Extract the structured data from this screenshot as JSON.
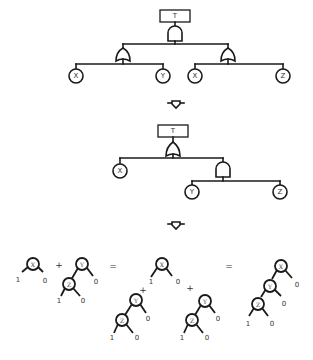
{
  "diagram": {
    "tree1": {
      "top_event": "T",
      "top_gate": "AND",
      "left_gate": {
        "type": "OR",
        "children": [
          "X",
          "Y"
        ]
      },
      "right_gate": {
        "type": "OR",
        "children": [
          "X",
          "Z"
        ]
      }
    },
    "arrow1": "down-arrow",
    "tree2": {
      "top_event": "T",
      "top_gate": "OR",
      "basic_event": "X",
      "sub_gate": {
        "type": "AND",
        "children": [
          "Y",
          "Z"
        ]
      }
    },
    "arrow2": "down-arrow",
    "equation": {
      "op_plus": "+",
      "op_equals": "=",
      "term1": {
        "root": "X",
        "low_label": "1",
        "high_label": "0"
      },
      "term2": {
        "root": "Y",
        "child": "Z",
        "z_left": "1",
        "z_right": "0",
        "y_right": "0"
      },
      "middle": {
        "x_node": {
          "root": "X",
          "left": "1",
          "right": "0"
        },
        "yz_left": {
          "root": "Y",
          "child": "Z",
          "z_left": "1",
          "z_right": "0",
          "y_right": "0"
        },
        "yz_right": {
          "root": "Y",
          "child": "Z",
          "z_left": "1",
          "z_right": "0",
          "y_right": "0"
        }
      },
      "result": {
        "nodes": [
          "X",
          "Y",
          "Z"
        ],
        "x_right": "0",
        "y_right": "0",
        "z_left": "1",
        "z_right": "0"
      }
    }
  }
}
